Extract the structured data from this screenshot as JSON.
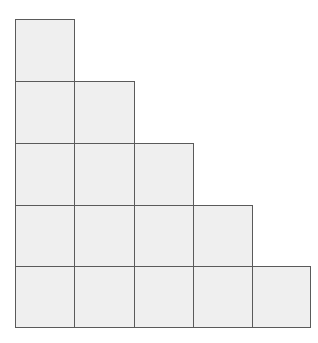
{
  "diagram": {
    "type": "staircase-grid",
    "rows": 5,
    "columns": 5,
    "row_lengths": [
      1,
      2,
      3,
      4,
      5
    ],
    "total_cells": 15,
    "cell_fill": "#efefef",
    "line_color": "#5a5a5a",
    "col_edges": [
      15,
      74,
      134,
      193,
      252,
      310
    ],
    "row_edges": [
      19,
      81,
      143,
      205,
      266,
      327
    ]
  }
}
